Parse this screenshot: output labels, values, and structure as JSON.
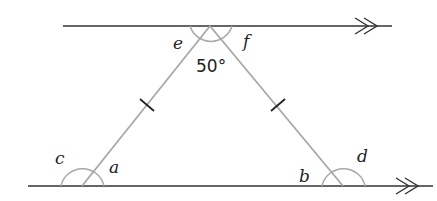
{
  "diagram": {
    "colors": {
      "parallel_line": "#333333",
      "triangle_side": "#a8a8a8",
      "angle_arc": "#a8a8a8",
      "tick_mark": "#222222",
      "text": "#222222"
    },
    "labels": {
      "apex_angle": "50°",
      "e": "e",
      "f": "f",
      "a": "a",
      "b": "b",
      "c": "c",
      "d": "d"
    },
    "parallel_marker": "double-arrow"
  }
}
